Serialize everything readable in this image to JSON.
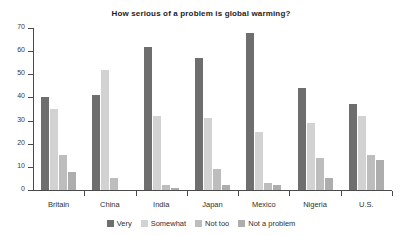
{
  "chart_data": {
    "type": "bar",
    "title": "How serious of a problem is global warming?",
    "xlabel": "",
    "ylabel": "",
    "ylim": [
      0,
      70
    ],
    "yticks": [
      0,
      10,
      20,
      30,
      40,
      50,
      60,
      70
    ],
    "grid": false,
    "legend_position": "bottom",
    "categories": [
      "Britain",
      "China",
      "India",
      "Japan",
      "Mexico",
      "Nigeria",
      "U.S."
    ],
    "series": [
      {
        "name": "Very",
        "color": "#6e6e6e",
        "values": [
          40,
          41,
          62,
          57,
          68,
          44,
          37
        ]
      },
      {
        "name": "Somewhat",
        "color": "#d2d2d2",
        "values": [
          35,
          52,
          32,
          31,
          25,
          29,
          32
        ]
      },
      {
        "name": "Not too",
        "color": "#bdbdbd",
        "values": [
          15,
          5,
          2,
          9,
          3,
          14,
          15
        ]
      },
      {
        "name": "Not a problem",
        "color": "#adadad",
        "values": [
          8,
          0,
          1,
          2,
          2,
          5,
          13
        ]
      }
    ]
  }
}
